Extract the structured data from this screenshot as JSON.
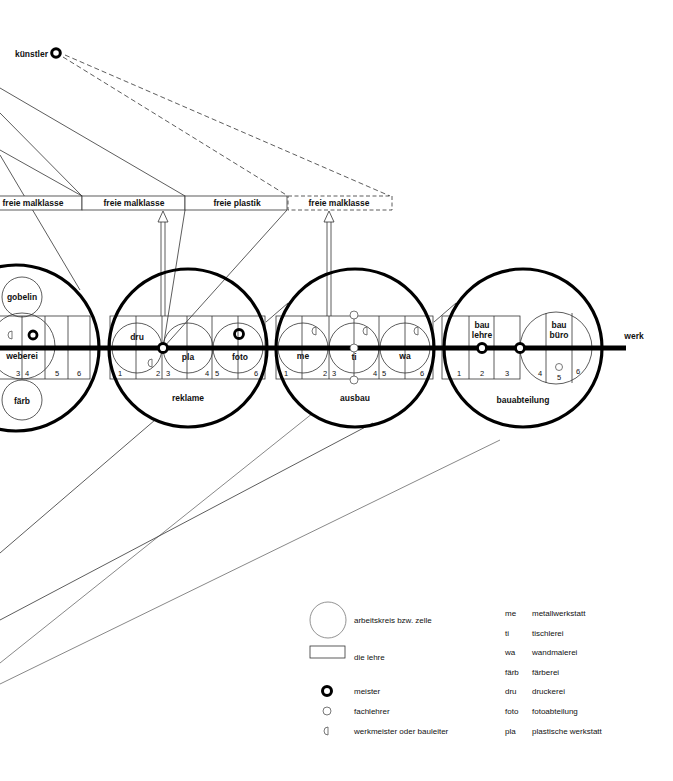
{
  "top_node": {
    "label": "künstler",
    "icon": "meister-ring-icon"
  },
  "classes": [
    {
      "label": "freie malklasse",
      "style": "solid"
    },
    {
      "label": "freie malklasse",
      "style": "solid"
    },
    {
      "label": "freie plastik",
      "style": "solid"
    },
    {
      "label": "freie malklasse",
      "style": "dashed"
    }
  ],
  "axis_label": "werk",
  "departments": [
    {
      "name": "weberei-group",
      "cells": [
        {
          "label": "gobelin"
        },
        {
          "label": "weberei"
        },
        {
          "label": "färb"
        }
      ],
      "numbers": [
        "3",
        "4",
        "5",
        "6"
      ]
    },
    {
      "name": "reklame",
      "cells": [
        {
          "label": "dru"
        },
        {
          "label": "pla"
        },
        {
          "label": "foto"
        }
      ],
      "numbers": [
        "1",
        "2",
        "3",
        "4",
        "5",
        "6"
      ]
    },
    {
      "name": "ausbau",
      "cells": [
        {
          "label": "me"
        },
        {
          "label": "ti"
        },
        {
          "label": "wa"
        }
      ],
      "numbers": [
        "1",
        "2",
        "3",
        "4",
        "5",
        "6"
      ]
    },
    {
      "name": "bauabteilung",
      "cells": [
        {
          "label": "bau\nlehre"
        },
        {
          "label": "bau\nbüro"
        }
      ],
      "numbers": [
        "1",
        "2",
        "3",
        "4",
        "5",
        "6"
      ]
    }
  ],
  "legend_symbols": [
    {
      "icon": "circle-icon",
      "label": "arbeitskreis bzw. zelle"
    },
    {
      "icon": "rectangle-icon",
      "label": "die lehre"
    },
    {
      "icon": "meister-ring-icon",
      "label": "meister"
    },
    {
      "icon": "small-circle-icon",
      "label": "fachlehrer"
    },
    {
      "icon": "half-circle-icon",
      "label": "werkmeister oder bauleiter"
    }
  ],
  "legend_abbreviations": [
    {
      "abbr": "me",
      "full": "metallwerkstatt"
    },
    {
      "abbr": "ti",
      "full": "tischlerei"
    },
    {
      "abbr": "wa",
      "full": "wandmalerei"
    },
    {
      "abbr": "färb",
      "full": "färberei"
    },
    {
      "abbr": "dru",
      "full": "druckerei"
    },
    {
      "abbr": "foto",
      "full": "fotoabteilung"
    },
    {
      "abbr": "pla",
      "full": "plastische werkstatt"
    }
  ]
}
